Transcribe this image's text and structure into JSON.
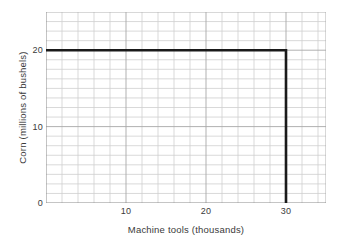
{
  "chart_data": {
    "type": "line",
    "title": "",
    "subtitle": "",
    "xlabel": "Machine tools (thousands)",
    "ylabel": "Corn (millions of bushels)",
    "xlim": [
      0,
      35
    ],
    "ylim": [
      0,
      25
    ],
    "xticks": [
      10,
      20,
      30
    ],
    "xticklabels": [
      "10",
      "20",
      "30"
    ],
    "yticks": [
      0,
      10,
      20
    ],
    "yticklabels": [
      "0",
      "10",
      "20"
    ],
    "x_minor_step": 2,
    "y_minor_step": 1.25,
    "grid": true,
    "grid_color": "#c8c8c8",
    "legend": null,
    "series": [
      {
        "name": "Leontief isoquant",
        "shape": "L-shaped right angle",
        "line_color": "#1a1a1a",
        "line_width": 2.6,
        "corner": {
          "x": 30,
          "y": 20
        },
        "x": [
          0,
          30,
          30
        ],
        "y": [
          20,
          20,
          0
        ],
        "points": [
          {
            "x": 0,
            "y": 20
          },
          {
            "x": 30,
            "y": 20
          },
          {
            "x": 30,
            "y": 0
          }
        ]
      }
    ],
    "annotations": []
  },
  "axes": {
    "x_tick_0": "10",
    "x_tick_1": "20",
    "x_tick_2": "30",
    "y_tick_0": "0",
    "y_tick_1": "10",
    "y_tick_2": "20"
  },
  "colors": {
    "line": "#1a1a1a",
    "grid": "#c8c8c8",
    "axis": "#8a8a8a",
    "text": "#3a3a3a",
    "background": "#ffffff"
  }
}
